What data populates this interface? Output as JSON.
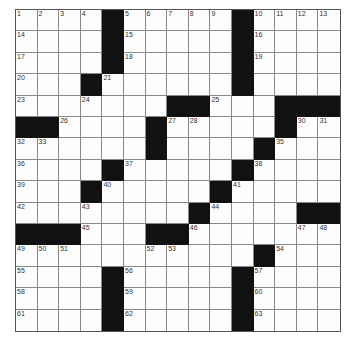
{
  "puzzle": {
    "rows": 15,
    "cols": 15,
    "colors": {
      "black": "#111111",
      "white": "#fdfdfd",
      "line": "#888888"
    },
    "layout": [
      "....#.....#....",
      "....#.....#....",
      "....#.....#....",
      "...#......#....",
      ".......##...###",
      "##....#.....#..",
      "......#....#...",
      "....#.....#....",
      "...#.....#.....",
      "........#....##",
      "###...##.......",
      "...........#...",
      "....#.....#....",
      "....#.....#....",
      "....#.....#...."
    ],
    "numbers": [
      {
        "r": 0,
        "c": 0,
        "n": "1"
      },
      {
        "r": 0,
        "c": 1,
        "n": "2"
      },
      {
        "r": 0,
        "c": 2,
        "n": "3"
      },
      {
        "r": 0,
        "c": 3,
        "n": "4"
      },
      {
        "r": 0,
        "c": 5,
        "n": "5"
      },
      {
        "r": 0,
        "c": 6,
        "n": "6"
      },
      {
        "r": 0,
        "c": 7,
        "n": "7"
      },
      {
        "r": 0,
        "c": 8,
        "n": "8"
      },
      {
        "r": 0,
        "c": 9,
        "n": "9"
      },
      {
        "r": 0,
        "c": 11,
        "n": "10"
      },
      {
        "r": 0,
        "c": 12,
        "n": "11"
      },
      {
        "r": 0,
        "c": 13,
        "n": "12"
      },
      {
        "r": 0,
        "c": 14,
        "n": "13"
      },
      {
        "r": 1,
        "c": 0,
        "n": "14"
      },
      {
        "r": 1,
        "c": 5,
        "n": "15"
      },
      {
        "r": 1,
        "c": 11,
        "n": "16"
      },
      {
        "r": 2,
        "c": 0,
        "n": "17"
      },
      {
        "r": 2,
        "c": 5,
        "n": "18"
      },
      {
        "r": 2,
        "c": 11,
        "n": "19"
      },
      {
        "r": 3,
        "c": 0,
        "n": "20"
      },
      {
        "r": 3,
        "c": 4,
        "n": "21"
      },
      {
        "r": 3,
        "c": 10,
        "n": "22"
      },
      {
        "r": 4,
        "c": 0,
        "n": "23"
      },
      {
        "r": 4,
        "c": 3,
        "n": "24"
      },
      {
        "r": 4,
        "c": 9,
        "n": "25"
      },
      {
        "r": 5,
        "c": 2,
        "n": "26"
      },
      {
        "r": 5,
        "c": 7,
        "n": "27"
      },
      {
        "r": 5,
        "c": 8,
        "n": "28"
      },
      {
        "r": 5,
        "c": 12,
        "n": "29"
      },
      {
        "r": 5,
        "c": 13,
        "n": "30"
      },
      {
        "r": 5,
        "c": 14,
        "n": "31"
      },
      {
        "r": 6,
        "c": 0,
        "n": "32"
      },
      {
        "r": 6,
        "c": 1,
        "n": "33"
      },
      {
        "r": 6,
        "c": 6,
        "n": "34"
      },
      {
        "r": 6,
        "c": 12,
        "n": "35"
      },
      {
        "r": 7,
        "c": 0,
        "n": "36"
      },
      {
        "r": 7,
        "c": 5,
        "n": "37"
      },
      {
        "r": 7,
        "c": 11,
        "n": "38"
      },
      {
        "r": 8,
        "c": 0,
        "n": "39"
      },
      {
        "r": 8,
        "c": 4,
        "n": "40"
      },
      {
        "r": 8,
        "c": 10,
        "n": "41"
      },
      {
        "r": 9,
        "c": 0,
        "n": "42"
      },
      {
        "r": 9,
        "c": 3,
        "n": "43"
      },
      {
        "r": 9,
        "c": 9,
        "n": "44"
      },
      {
        "r": 10,
        "c": 3,
        "n": "45"
      },
      {
        "r": 10,
        "c": 8,
        "n": "46"
      },
      {
        "r": 10,
        "c": 13,
        "n": "47"
      },
      {
        "r": 10,
        "c": 14,
        "n": "48"
      },
      {
        "r": 11,
        "c": 0,
        "n": "49"
      },
      {
        "r": 11,
        "c": 1,
        "n": "50"
      },
      {
        "r": 11,
        "c": 2,
        "n": "51"
      },
      {
        "r": 11,
        "c": 6,
        "n": "52"
      },
      {
        "r": 11,
        "c": 7,
        "n": "53"
      },
      {
        "r": 11,
        "c": 12,
        "n": "54"
      },
      {
        "r": 12,
        "c": 0,
        "n": "55"
      },
      {
        "r": 12,
        "c": 5,
        "n": "56"
      },
      {
        "r": 12,
        "c": 11,
        "n": "57"
      },
      {
        "r": 13,
        "c": 0,
        "n": "58"
      },
      {
        "r": 13,
        "c": 5,
        "n": "59"
      },
      {
        "r": 13,
        "c": 11,
        "n": "60"
      },
      {
        "r": 14,
        "c": 0,
        "n": "61"
      },
      {
        "r": 14,
        "c": 5,
        "n": "62"
      },
      {
        "r": 14,
        "c": 11,
        "n": "63"
      }
    ]
  }
}
